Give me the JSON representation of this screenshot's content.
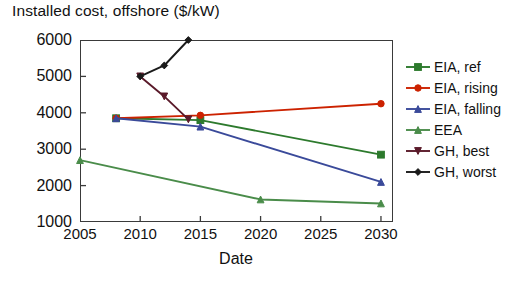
{
  "chart_data": {
    "type": "line",
    "title": "Installed cost, offshore ($/kW)",
    "xlabel": "Date",
    "ylabel": "",
    "xlim": [
      2005,
      2031
    ],
    "ylim": [
      1000,
      6000
    ],
    "xticks": [
      2005,
      2010,
      2015,
      2020,
      2025,
      2030
    ],
    "yticks": [
      1000,
      2000,
      3000,
      4000,
      5000,
      6000
    ],
    "grid": false,
    "legend_position": "right",
    "series": [
      {
        "name": "EIA, ref",
        "color": "#2d7a2d",
        "marker": "square",
        "x": [
          2008,
          2015,
          2030
        ],
        "values": [
          3850,
          3800,
          2850
        ]
      },
      {
        "name": "EIA, rising",
        "color": "#cc2200",
        "marker": "circle",
        "x": [
          2008,
          2015,
          2030
        ],
        "values": [
          3850,
          3930,
          4250
        ]
      },
      {
        "name": "EIA, falling",
        "color": "#3a4a9a",
        "marker": "triangle-up",
        "x": [
          2008,
          2015,
          2030
        ],
        "values": [
          3850,
          3620,
          2100
        ]
      },
      {
        "name": "EEA",
        "color": "#4a8c4a",
        "marker": "triangle-up",
        "x": [
          2005,
          2020,
          2030
        ],
        "values": [
          2700,
          1620,
          1510
        ]
      },
      {
        "name": "GH, best",
        "color": "#5a1a2a",
        "marker": "triangle-down",
        "x": [
          2010,
          2012,
          2014
        ],
        "values": [
          5000,
          4450,
          3820
        ]
      },
      {
        "name": "GH, worst",
        "color": "#1a1a1a",
        "marker": "diamond",
        "x": [
          2010,
          2012,
          2014
        ],
        "values": [
          5000,
          5300,
          6000
        ]
      }
    ]
  },
  "legend": {
    "entries": [
      {
        "label": "EIA, ref"
      },
      {
        "label": "EIA, rising"
      },
      {
        "label": "EIA, falling"
      },
      {
        "label": "EEA"
      },
      {
        "label": "GH, best"
      },
      {
        "label": "GH, worst"
      }
    ]
  }
}
